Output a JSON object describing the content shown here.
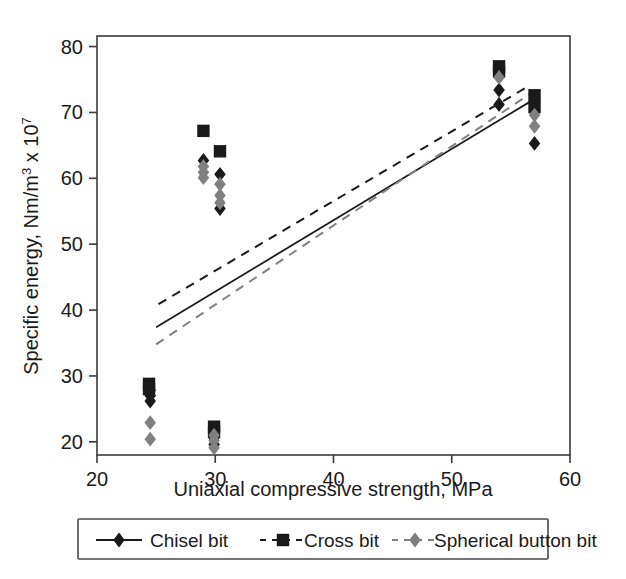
{
  "figure": {
    "background": "#ffffff",
    "frame_color": "#3b3b3b",
    "width": 626,
    "height": 579
  },
  "colors": {
    "chisel": "#1a1a1a",
    "cross": "#1a1a1a",
    "spherical": "#808080",
    "axis": "#3b3b3b",
    "text": "#1a1a1a",
    "legend_border": "#4a4a4a"
  },
  "axes": {
    "x": {
      "label": "Uniaxial compressive strength, MPa",
      "ticks": [
        20,
        30,
        40,
        50,
        60
      ],
      "tick_labels": [
        "20",
        "30",
        "40",
        "50",
        "60"
      ],
      "min": 20,
      "max": 60
    },
    "y": {
      "label_prefix": "Specific energy, Nm/m",
      "label_exp1": "3",
      "label_mid": " x 10",
      "label_exp2": "7",
      "label_full": "Specific energy, Nm/m3 x 107",
      "ticks": [
        20,
        30,
        40,
        50,
        60,
        70,
        80
      ],
      "tick_labels": [
        "20",
        "30",
        "40",
        "50",
        "60",
        "70",
        "80"
      ],
      "min": 18,
      "max": 81.6
    }
  },
  "legend": {
    "items": [
      {
        "label": "Chisel bit",
        "marker": "diamond",
        "line": "solid",
        "color": "#1a1a1a"
      },
      {
        "label": "Cross bit",
        "marker": "square",
        "line": "dashed",
        "color": "#1a1a1a"
      },
      {
        "label": "Spherical button bit",
        "marker": "diamond",
        "line": "dashed",
        "color": "#808080"
      }
    ]
  },
  "chart_data": {
    "type": "scatter",
    "title": "",
    "xlabel": "Uniaxial compressive strength, MPa",
    "ylabel": "Specific energy, Nm/m^3 x 10^7",
    "xlim": [
      20,
      60
    ],
    "ylim": [
      18,
      81.6
    ],
    "grid": false,
    "legend_position": "below-axes",
    "series": [
      {
        "name": "Chisel bit",
        "marker": "diamond",
        "color": "#1a1a1a",
        "points": [
          {
            "x": 24.5,
            "y": 27.8
          },
          {
            "x": 24.5,
            "y": 27.0
          },
          {
            "x": 24.5,
            "y": 26.2
          },
          {
            "x": 29.9,
            "y": 21.4
          },
          {
            "x": 29.9,
            "y": 20.6
          },
          {
            "x": 29.9,
            "y": 19.6
          },
          {
            "x": 29.0,
            "y": 62.7
          },
          {
            "x": 30.4,
            "y": 60.6
          },
          {
            "x": 30.4,
            "y": 55.4
          },
          {
            "x": 54.0,
            "y": 73.4
          },
          {
            "x": 54.0,
            "y": 71.2
          },
          {
            "x": 57.0,
            "y": 70.2
          },
          {
            "x": 57.0,
            "y": 65.3
          }
        ]
      },
      {
        "name": "Cross bit",
        "marker": "square",
        "color": "#1a1a1a",
        "points": [
          {
            "x": 24.4,
            "y": 28.8
          },
          {
            "x": 24.4,
            "y": 28.0
          },
          {
            "x": 29.9,
            "y": 22.3
          },
          {
            "x": 29.9,
            "y": 21.5
          },
          {
            "x": 29.0,
            "y": 67.2
          },
          {
            "x": 30.4,
            "y": 64.1
          },
          {
            "x": 54.0,
            "y": 77.0
          },
          {
            "x": 54.0,
            "y": 76.2
          },
          {
            "x": 57.0,
            "y": 72.6
          },
          {
            "x": 57.0,
            "y": 70.8
          }
        ]
      },
      {
        "name": "Spherical button bit",
        "marker": "diamond",
        "color": "#808080",
        "points": [
          {
            "x": 24.5,
            "y": 22.9
          },
          {
            "x": 24.5,
            "y": 20.4
          },
          {
            "x": 29.9,
            "y": 21.0
          },
          {
            "x": 29.9,
            "y": 20.2
          },
          {
            "x": 29.9,
            "y": 19.1
          },
          {
            "x": 29.0,
            "y": 61.8
          },
          {
            "x": 29.0,
            "y": 60.9
          },
          {
            "x": 29.0,
            "y": 60.1
          },
          {
            "x": 30.4,
            "y": 59.1
          },
          {
            "x": 30.4,
            "y": 57.4
          },
          {
            "x": 30.4,
            "y": 56.3
          },
          {
            "x": 54.0,
            "y": 75.3
          },
          {
            "x": 57.0,
            "y": 69.6
          },
          {
            "x": 57.0,
            "y": 67.9
          }
        ]
      }
    ],
    "trendlines": [
      {
        "name": "Chisel bit",
        "style": "solid",
        "color": "#1a1a1a",
        "x_start": 25.0,
        "y_start": 37.4,
        "x_end": 56.6,
        "y_end": 71.6
      },
      {
        "name": "Cross bit",
        "style": "dashed",
        "color": "#1a1a1a",
        "x_start": 25.2,
        "y_start": 40.9,
        "x_end": 56.6,
        "y_end": 74.1
      },
      {
        "name": "Spherical button bit",
        "style": "dashed",
        "color": "#808080",
        "x_start": 25.0,
        "y_start": 34.8,
        "x_end": 56.6,
        "y_end": 72.8
      }
    ]
  }
}
